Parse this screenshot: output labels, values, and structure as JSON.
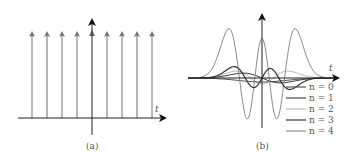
{
  "panels": [
    {
      "id": "a",
      "caption": "(a)",
      "axis_label": "t",
      "description": "Dirac comb: train of equally spaced unit impulses",
      "impulse_count": 9,
      "impulse_color": "#707070",
      "axis_color": "#222222"
    },
    {
      "id": "b",
      "caption": "(b)",
      "axis_label": "t",
      "description": "Hermite functions of order n = 0..4",
      "legend": [
        {
          "label": "n = 0",
          "color": "#555555"
        },
        {
          "label": "n = 1",
          "color": "#444444"
        },
        {
          "label": "n = 2",
          "color": "#bdbdbd"
        },
        {
          "label": "n = 3",
          "color": "#333333"
        },
        {
          "label": "n = 4",
          "color": "#8c8c8c"
        }
      ]
    }
  ],
  "chart_data": [
    {
      "type": "line",
      "title": "(a)",
      "xlabel": "t",
      "ylabel": "",
      "series": [
        {
          "name": "impulse train",
          "x": [
            -4,
            -3,
            -2,
            -1,
            0,
            1,
            2,
            3,
            4
          ],
          "values": [
            1,
            1,
            1,
            1,
            1,
            1,
            1,
            1,
            1
          ]
        }
      ],
      "grid": false,
      "legend": "none"
    },
    {
      "type": "line",
      "title": "(b)",
      "xlabel": "t",
      "ylabel": "",
      "series": [
        {
          "name": "n=0"
        },
        {
          "name": "n=1"
        },
        {
          "name": "n=2"
        },
        {
          "name": "n=3"
        },
        {
          "name": "n=4"
        }
      ],
      "grid": false,
      "legend_position": "lower right"
    }
  ]
}
